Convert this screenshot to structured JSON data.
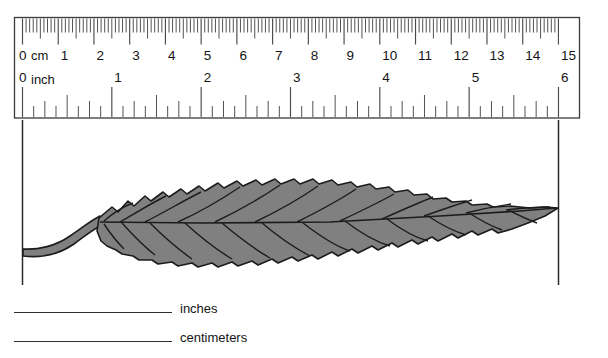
{
  "worksheet": {
    "title": "Leaf measurement worksheet",
    "background_color": "#ffffff"
  },
  "ruler": {
    "name": "double-scale-ruler",
    "left_px": 14,
    "right_px": 580,
    "top_px": 17,
    "bottom_px": 118,
    "zero_px": 22,
    "border_color": "#3a3a3a",
    "tick_color": "#4a4a4a",
    "cm_scale": {
      "unit_word": "cm",
      "zero_label": "0",
      "px_per_unit": 35.73,
      "minor_divisions_per_unit": 10,
      "labels": [
        "1",
        "2",
        "3",
        "4",
        "5",
        "6",
        "7",
        "8",
        "9",
        "10",
        "11",
        "12",
        "13",
        "14",
        "15"
      ]
    },
    "inch_scale": {
      "unit_word": "inch",
      "zero_label": "0",
      "px_per_unit": 89.33,
      "minor_divisions_per_unit": 8,
      "labels": [
        "1",
        "2",
        "3",
        "4",
        "5",
        "6"
      ]
    }
  },
  "measure_guides": {
    "left_guide_x": 22,
    "right_guide_x": 558,
    "guide_top": 120,
    "guide_bottom": 285,
    "color": "#2b2b2b"
  },
  "leaf": {
    "name": "serrated-leaf-specimen",
    "fill_color": "#808080",
    "outline_color": "#1c1c1c",
    "vein_color": "#1c1c1c",
    "tip_x": 558,
    "stem_base_x": 22,
    "description": "Gray serrated leaf with petiole at left guide and tip at right guide"
  },
  "answers": [
    {
      "name": "inches-answer",
      "label": "inches",
      "value": ""
    },
    {
      "name": "centimeters-answer",
      "label": "centimeters",
      "value": ""
    }
  ]
}
